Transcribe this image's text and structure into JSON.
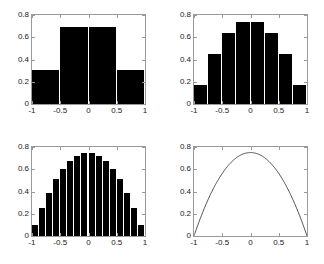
{
  "figure": {
    "title": "",
    "background_color": "#ffffff",
    "axis_color": "#9a9a9a",
    "bar_color": "#000000",
    "curve_color": "#3a3a3a",
    "layout": "2x2 subplot grid"
  },
  "axes": {
    "xlim": [
      -1,
      1
    ],
    "ylim": [
      0,
      0.8
    ],
    "xticks": [
      -1,
      -0.5,
      0,
      0.5,
      1
    ],
    "yticks": [
      0,
      0.2,
      0.4,
      0.6,
      0.8
    ],
    "xtick_labels": [
      "-1",
      "-0.5",
      "0",
      "0.5",
      "1"
    ],
    "ytick_labels": [
      "0",
      "0.2",
      "0.4",
      "0.6",
      "0.8"
    ],
    "grid": false,
    "legend": "none"
  },
  "chart_data": [
    {
      "type": "bar",
      "panel": "top-left",
      "title": "",
      "xlabel": "",
      "ylabel": "",
      "xlim": [
        -1,
        1
      ],
      "ylim": [
        0,
        0.8
      ],
      "xticks": [
        -1,
        -0.5,
        0,
        0.5,
        1
      ],
      "yticks": [
        0,
        0.2,
        0.4,
        0.6,
        0.8
      ],
      "xtick_labels": [
        "-1",
        "-0.5",
        "0",
        "0.5",
        "1"
      ],
      "ytick_labels": [
        "0",
        "0.2",
        "0.4",
        "0.6",
        "0.8"
      ],
      "n_bins": 4,
      "bin_width": 0.5,
      "bin_edges": [
        -1,
        -0.5,
        0,
        0.5,
        1
      ],
      "categories": [
        "-0.75",
        "-0.25",
        "0.25",
        "0.75"
      ],
      "values": [
        0.31,
        0.69,
        0.69,
        0.31
      ],
      "grid": false,
      "legend": "none"
    },
    {
      "type": "bar",
      "panel": "top-right",
      "title": "",
      "xlabel": "",
      "ylabel": "",
      "xlim": [
        -1,
        1
      ],
      "ylim": [
        0,
        0.8
      ],
      "xticks": [
        -1,
        -0.5,
        0,
        0.5,
        1
      ],
      "yticks": [
        0,
        0.2,
        0.4,
        0.6,
        0.8
      ],
      "xtick_labels": [
        "-1",
        "-0.5",
        "0",
        "0.5",
        "1"
      ],
      "ytick_labels": [
        "0",
        "0.2",
        "0.4",
        "0.6",
        "0.8"
      ],
      "n_bins": 8,
      "bin_width": 0.25,
      "bin_edges": [
        -1,
        -0.75,
        -0.5,
        -0.25,
        0,
        0.25,
        0.5,
        0.75,
        1
      ],
      "categories": [
        "-0.875",
        "-0.625",
        "-0.375",
        "-0.125",
        "0.125",
        "0.375",
        "0.625",
        "0.875"
      ],
      "values": [
        0.175,
        0.45,
        0.64,
        0.735,
        0.735,
        0.64,
        0.45,
        0.175
      ],
      "grid": false,
      "legend": "none"
    },
    {
      "type": "bar",
      "panel": "bottom-left",
      "title": "",
      "xlabel": "",
      "ylabel": "",
      "xlim": [
        -1,
        1
      ],
      "ylim": [
        0,
        0.8
      ],
      "xticks": [
        -1,
        -0.5,
        0,
        0.5,
        1
      ],
      "yticks": [
        0,
        0.2,
        0.4,
        0.6,
        0.8
      ],
      "xtick_labels": [
        "-1",
        "-0.5",
        "0",
        "0.5",
        "1"
      ],
      "ytick_labels": [
        "0",
        "0.2",
        "0.4",
        "0.6",
        "0.8"
      ],
      "n_bins": 16,
      "bin_width": 0.125,
      "bin_edges": [
        -1,
        -0.875,
        -0.75,
        -0.625,
        -0.5,
        -0.375,
        -0.25,
        -0.125,
        0,
        0.125,
        0.25,
        0.375,
        0.5,
        0.625,
        0.75,
        0.875,
        1
      ],
      "categories": [
        "-0.9375",
        "-0.8125",
        "-0.6875",
        "-0.5625",
        "-0.4375",
        "-0.3125",
        "-0.1875",
        "-0.0625",
        "0.0625",
        "0.1875",
        "0.3125",
        "0.4375",
        "0.5625",
        "0.6875",
        "0.8125",
        "0.9375"
      ],
      "values": [
        0.095,
        0.255,
        0.39,
        0.51,
        0.605,
        0.675,
        0.72,
        0.748,
        0.748,
        0.72,
        0.675,
        0.605,
        0.51,
        0.39,
        0.255,
        0.095
      ],
      "grid": false,
      "legend": "none"
    },
    {
      "type": "line",
      "panel": "bottom-right",
      "title": "",
      "xlabel": "",
      "ylabel": "",
      "xlim": [
        -1,
        1
      ],
      "ylim": [
        0,
        0.8
      ],
      "xticks": [
        -1,
        -0.5,
        0,
        0.5,
        1
      ],
      "yticks": [
        0,
        0.2,
        0.4,
        0.6,
        0.8
      ],
      "xtick_labels": [
        "-1",
        "-0.5",
        "0",
        "0.5",
        "1"
      ],
      "ytick_labels": [
        "0",
        "0.2",
        "0.4",
        "0.6",
        "0.8"
      ],
      "formula": "y = 0.75 (1 - x^2)",
      "peak_value": 0.75,
      "x": [
        -1,
        -0.9,
        -0.8,
        -0.7,
        -0.6,
        -0.5,
        -0.4,
        -0.3,
        -0.2,
        -0.1,
        0,
        0.1,
        0.2,
        0.3,
        0.4,
        0.5,
        0.6,
        0.7,
        0.8,
        0.9,
        1
      ],
      "y": [
        0,
        0.1425,
        0.27,
        0.3825,
        0.48,
        0.5625,
        0.63,
        0.6825,
        0.72,
        0.7425,
        0.75,
        0.7425,
        0.72,
        0.6825,
        0.63,
        0.5625,
        0.48,
        0.3825,
        0.27,
        0.1425,
        0
      ],
      "grid": false,
      "legend": "none"
    }
  ]
}
